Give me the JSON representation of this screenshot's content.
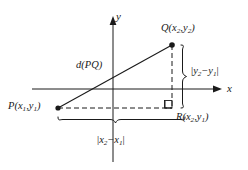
{
  "figure": {
    "background_color": "#ffffff",
    "stroke_color": "#1a1a1a",
    "axes": {
      "x_label": "x",
      "y_label": "y",
      "x_axis_y": 89,
      "y_axis_x": 113
    },
    "points": [
      {
        "name": "P",
        "label_text": "P(x",
        "sub1": "1",
        "comma": ",y",
        "sub2": "1",
        "close": ")",
        "x": 58,
        "y": 108
      },
      {
        "name": "Q",
        "label_text": "Q(x",
        "sub1": "2",
        "comma": ",y",
        "sub2": "2",
        "close": ")",
        "x": 172,
        "y": 45
      },
      {
        "name": "R",
        "label_text": "R(x",
        "sub1": "2",
        "comma": ",y",
        "sub2": "1",
        "close": ")",
        "x": 172,
        "y": 108
      }
    ],
    "labels": {
      "distance": "d(PQ)",
      "vertical_leg": {
        "bar_open": "|",
        "var1": "y",
        "sub1": "2",
        "minus": "−",
        "var2": "y",
        "sub2": "1",
        "bar_close": "|"
      },
      "horizontal_leg": {
        "bar_open": "|",
        "var1": "x",
        "sub1": "2",
        "minus": "−",
        "var2": "x",
        "sub2": "1",
        "bar_close": "|"
      }
    },
    "point_labels": {
      "P": {
        "letter": "P",
        "open": "(",
        "v1": "x",
        "s1": "1",
        "sep": ",",
        "v2": "y",
        "s2": "1",
        "close": ")"
      },
      "Q": {
        "letter": "Q",
        "open": "(",
        "v1": "x",
        "s1": "2",
        "sep": ",",
        "v2": "y",
        "s2": "2",
        "close": ")"
      },
      "R": {
        "letter": "R",
        "open": "(",
        "v1": "x",
        "s1": "2",
        "sep": ",",
        "v2": "y",
        "s2": "1",
        "close": ")"
      }
    },
    "annotations": {
      "right_angle_marker": "right-angle-square",
      "hypotenuse_style": "solid",
      "leg_style": "dashed",
      "vertical_brace": "curly-brace-vertical",
      "horizontal_brace": "curly-brace-horizontal"
    }
  }
}
